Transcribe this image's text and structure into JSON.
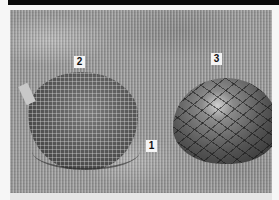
{
  "image": {
    "description": "Grayscale photograph of two military helmets covered with netting on a camouflage-pattern fabric background",
    "callouts": [
      {
        "id": "1",
        "label": "1",
        "refers_to": "camouflage fabric background"
      },
      {
        "id": "2",
        "label": "2",
        "refers_to": "helmet with fine mesh netting (left)"
      },
      {
        "id": "3",
        "label": "3",
        "refers_to": "helmet with coarse netting (right)"
      }
    ]
  }
}
